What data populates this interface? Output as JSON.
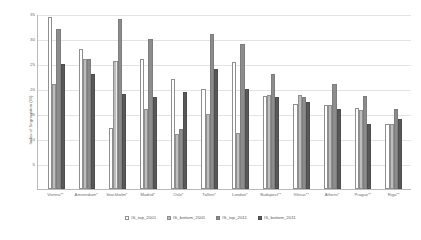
{
  "chart_data": {
    "type": "bar",
    "title": "",
    "xlabel": "",
    "ylabel": "Index of Segregation (IS)",
    "ylim": [
      0,
      35
    ],
    "yticks": [
      0,
      5,
      10,
      15,
      20,
      25,
      30,
      35
    ],
    "grid": true,
    "legend_position": "bottom",
    "categories": [
      "Vienna**",
      "Amsterdam*",
      "Stockholm*",
      "Madrid*",
      "Oslo*",
      "Tallinn*",
      "London*",
      "Budapest**",
      "Vilnius**",
      "Athens*",
      "Prague**",
      "Riga**"
    ],
    "series": [
      {
        "name": "IS_top_2001",
        "fill": "white-outline",
        "color": "#ffffff",
        "values": [
          34.5,
          28.0,
          12.2,
          26.0,
          22.0,
          20.0,
          25.5,
          18.7,
          17.0,
          16.8,
          16.3,
          13.0
        ]
      },
      {
        "name": "IS_bottom_2001",
        "fill": "light-hatched",
        "color": "#bdbdbd",
        "values": [
          21.0,
          26.0,
          25.7,
          16.0,
          11.0,
          15.0,
          11.2,
          18.8,
          18.8,
          16.8,
          15.8,
          13.0
        ]
      },
      {
        "name": "IS_top_2011",
        "fill": "medium-gray",
        "color": "#8c8c8c",
        "values": [
          32.0,
          26.0,
          34.0,
          30.0,
          12.0,
          31.0,
          29.0,
          23.0,
          18.5,
          21.0,
          18.7,
          16.0
        ]
      },
      {
        "name": "IS_bottom_2011",
        "fill": "dark-gray",
        "color": "#585858",
        "values": [
          25.0,
          23.0,
          19.0,
          18.5,
          19.5,
          24.0,
          20.0,
          18.5,
          17.5,
          16.0,
          13.0,
          14.0
        ]
      }
    ]
  }
}
